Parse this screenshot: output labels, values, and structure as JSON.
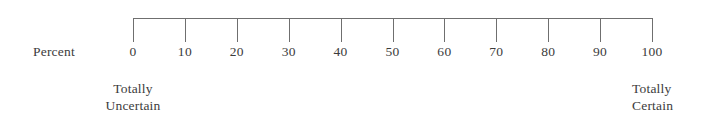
{
  "figure": {
    "axis_name": "Percent",
    "left_anchor": {
      "line1": "Totally",
      "line2": "Uncertain"
    },
    "right_anchor": {
      "line1": "Totally",
      "line2": "Certain"
    },
    "line_color": "#6f6f6f",
    "text_color": "#3c3c3c",
    "background_color": "#ffffff"
  },
  "chart_data": {
    "type": "line",
    "title": "",
    "subtitle": "",
    "xlabel": "Percent",
    "ylabel": "",
    "orientation": "horizontal",
    "grid": false,
    "legend": null,
    "xlim": [
      0,
      100
    ],
    "tick_step": 10,
    "categories": [
      "0",
      "10",
      "20",
      "30",
      "40",
      "50",
      "60",
      "70",
      "80",
      "90",
      "100"
    ],
    "values": [
      0,
      10,
      20,
      30,
      40,
      50,
      60,
      70,
      80,
      90,
      100
    ],
    "ticks": [
      {
        "value": 0,
        "label": "0"
      },
      {
        "value": 10,
        "label": "10"
      },
      {
        "value": 20,
        "label": "20"
      },
      {
        "value": 30,
        "label": "30"
      },
      {
        "value": 40,
        "label": "40"
      },
      {
        "value": 50,
        "label": "50"
      },
      {
        "value": 60,
        "label": "60"
      },
      {
        "value": 70,
        "label": "70"
      },
      {
        "value": 80,
        "label": "80"
      },
      {
        "value": 90,
        "label": "90"
      },
      {
        "value": 100,
        "label": "100"
      }
    ],
    "annotations": [
      {
        "at": 0,
        "text": "Totally Uncertain"
      },
      {
        "at": 100,
        "text": "Totally Certain"
      }
    ]
  }
}
